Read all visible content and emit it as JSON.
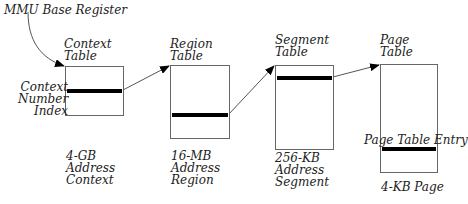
{
  "diagram": {
    "base_register_label": "MMU Base Register",
    "tables": [
      {
        "title": "Context\nTable",
        "caption": "4-GB\nAddress\nContext"
      },
      {
        "title": "Region\nTable",
        "caption": "16-MB\nAddress\nRegion"
      },
      {
        "title": "Segment\nTable",
        "caption": "256-KB\nAddress\nSegment"
      },
      {
        "title": "Page\nTable",
        "caption": "4-KB Page"
      }
    ],
    "index_label": "Context\nNumber\nIndex",
    "entry_label": "Page Table Entry",
    "colors": {
      "line": "#000000",
      "border": "#666666",
      "background": "#ffffff"
    }
  }
}
